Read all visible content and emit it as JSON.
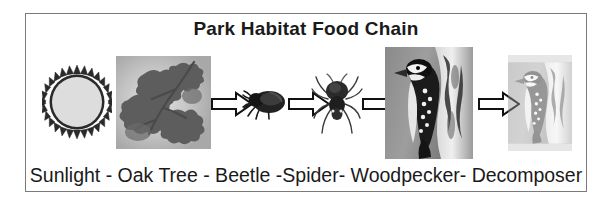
{
  "diagram": {
    "title": "Park Habitat Food Chain",
    "caption": "Sunlight - Oak Tree - Beetle -Spider- Woodpecker- Decomposer",
    "border_color": "#7b7b7b",
    "background_color": "#ffffff",
    "text_color": "#1a1a1a",
    "stages": [
      {
        "id": "sunlight",
        "label": "Sunlight",
        "icon": "sun-icon"
      },
      {
        "id": "oak-tree",
        "label": "Oak Tree",
        "icon": "oak-leaves-photo"
      },
      {
        "id": "beetle",
        "label": "Beetle",
        "icon": "beetle-icon"
      },
      {
        "id": "spider",
        "label": "Spider",
        "icon": "spider-icon"
      },
      {
        "id": "woodpecker",
        "label": "Woodpecker",
        "icon": "woodpecker-photo"
      },
      {
        "id": "decomposer",
        "label": "Decomposer",
        "icon": "faded-woodpecker-photo"
      }
    ],
    "arrows": [
      {
        "id": "arrow-sunlight-to-oak",
        "direction": "right"
      },
      {
        "id": "arrow-oak-to-beetle",
        "direction": "right"
      },
      {
        "id": "arrow-beetle-to-spider",
        "direction": "right"
      },
      {
        "id": "arrow-spider-to-woodpecker",
        "direction": "right"
      },
      {
        "id": "arrow-woodpecker-to-decomposer",
        "direction": "right"
      }
    ]
  }
}
